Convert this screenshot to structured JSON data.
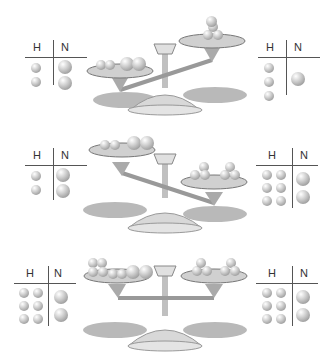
{
  "figure": {
    "column_labels": {
      "h": "H",
      "n": "N"
    },
    "panels": [
      {
        "state": "left pan heavier",
        "left_table": {
          "H": 2,
          "N": 2
        },
        "right_table": {
          "H": 3,
          "N": 1
        }
      },
      {
        "state": "right pan heavier",
        "left_table": {
          "H": 2,
          "N": 2
        },
        "right_table": {
          "H": 6,
          "N": 2
        }
      },
      {
        "state": "balanced",
        "left_table": {
          "H": 6,
          "N": 2
        },
        "right_table": {
          "H": 6,
          "N": 2
        }
      }
    ]
  },
  "colors": {
    "ball": "#aaaaaa",
    "line": "#555555",
    "scale": "#c8c8c8",
    "shadow": "#8a8a8a"
  }
}
